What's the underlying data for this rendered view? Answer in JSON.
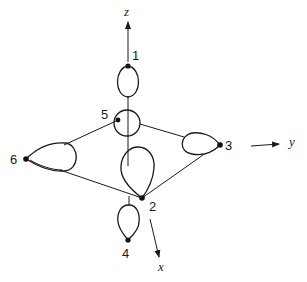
{
  "figure": {
    "axes": {
      "z": {
        "label": "z"
      },
      "y": {
        "label": "y"
      },
      "x": {
        "label": "x"
      }
    },
    "ligands": [
      {
        "id": 1,
        "label": "1",
        "position": "+z (top)"
      },
      {
        "id": 2,
        "label": "2",
        "position": "+x (front)"
      },
      {
        "id": 3,
        "label": "3",
        "position": "+y (right)"
      },
      {
        "id": 4,
        "label": "4",
        "position": "-z (bottom)"
      },
      {
        "id": 5,
        "label": "5",
        "position": "-x (back)"
      },
      {
        "id": 6,
        "label": "6",
        "position": "-y (left)"
      }
    ],
    "colors": {
      "line": "#1a1a1a",
      "background": "#ffffff"
    }
  }
}
